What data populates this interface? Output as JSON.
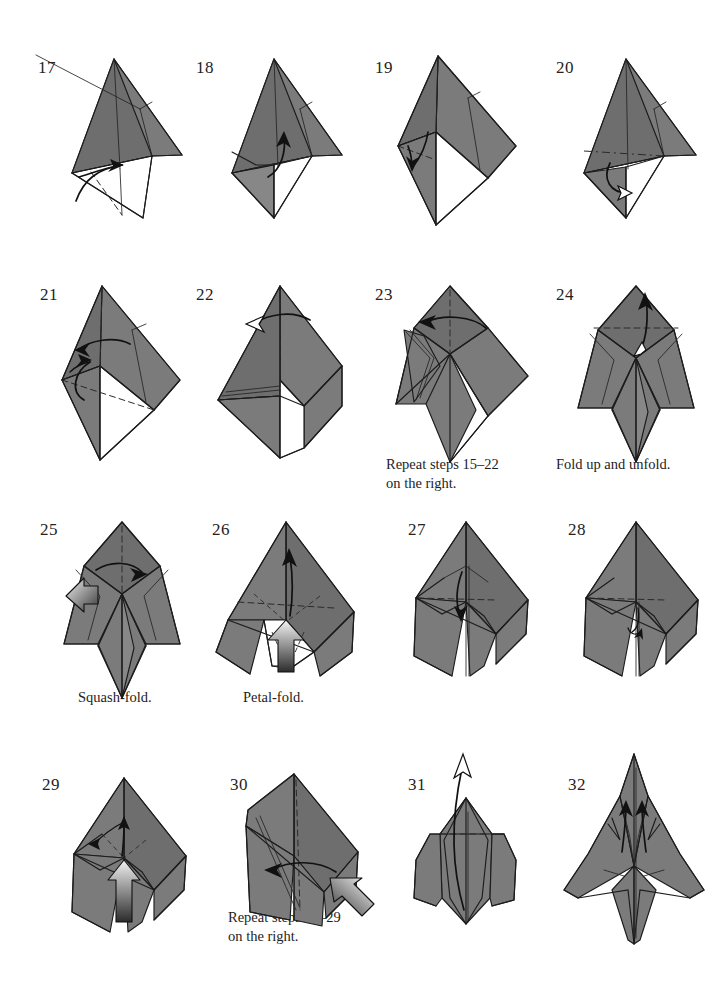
{
  "page": {
    "kind": "origami-instruction-diagram-page",
    "width": 720,
    "height": 982,
    "background_color": "#ffffff",
    "paper_color": "#7b7b7b",
    "line_color": "#1c1c1c",
    "columns": 4,
    "rows": 4
  },
  "steps": [
    {
      "number": "17",
      "num_x": 38,
      "num_y": 58,
      "fig_x": 36,
      "fig_y": 58,
      "caption": "",
      "caption_x": 0,
      "caption_y": 0,
      "variant": "kite-left-fold"
    },
    {
      "number": "18",
      "num_x": 196,
      "num_y": 58,
      "fig_x": 196,
      "fig_y": 58,
      "caption": "",
      "caption_x": 0,
      "caption_y": 0,
      "variant": "kite-flap-up"
    },
    {
      "number": "19",
      "num_x": 375,
      "num_y": 58,
      "fig_x": 370,
      "fig_y": 55,
      "caption": "",
      "caption_x": 0,
      "caption_y": 0,
      "variant": "kite-open-white"
    },
    {
      "number": "20",
      "num_x": 556,
      "num_y": 58,
      "fig_x": 552,
      "fig_y": 58,
      "caption": "",
      "caption_x": 0,
      "caption_y": 0,
      "variant": "kite-roll-under"
    },
    {
      "number": "21",
      "num_x": 40,
      "num_y": 285,
      "fig_x": 36,
      "fig_y": 282,
      "caption": "",
      "caption_x": 0,
      "caption_y": 0,
      "variant": "kite-left-swing"
    },
    {
      "number": "22",
      "num_x": 196,
      "num_y": 285,
      "fig_x": 190,
      "fig_y": 282,
      "caption": "",
      "caption_x": 0,
      "caption_y": 0,
      "variant": "kite-split-top"
    },
    {
      "number": "23",
      "num_x": 375,
      "num_y": 285,
      "fig_x": 370,
      "fig_y": 282,
      "caption": "Repeat steps 15–22\non the right.",
      "caption_x": 386,
      "caption_y": 455,
      "variant": "half-legs"
    },
    {
      "number": "24",
      "num_x": 556,
      "num_y": 285,
      "fig_x": 552,
      "fig_y": 282,
      "caption": "Fold up and unfold.",
      "caption_x": 556,
      "caption_y": 455,
      "variant": "two-legs-symmetric"
    },
    {
      "number": "25",
      "num_x": 40,
      "num_y": 520,
      "fig_x": 36,
      "fig_y": 516,
      "caption": "Squash-fold.",
      "caption_x": 78,
      "caption_y": 688,
      "variant": "squash"
    },
    {
      "number": "26",
      "num_x": 212,
      "num_y": 520,
      "fig_x": 196,
      "fig_y": 516,
      "caption": "Petal-fold.",
      "caption_x": 243,
      "caption_y": 688,
      "variant": "petal"
    },
    {
      "number": "27",
      "num_x": 408,
      "num_y": 520,
      "fig_x": 378,
      "fig_y": 516,
      "caption": "",
      "caption_x": 0,
      "caption_y": 0,
      "variant": "petal-done-arrow-down"
    },
    {
      "number": "28",
      "num_x": 568,
      "num_y": 520,
      "fig_x": 548,
      "fig_y": 516,
      "caption": "",
      "caption_x": 0,
      "caption_y": 0,
      "variant": "petal-done-small-arrow"
    },
    {
      "number": "29",
      "num_x": 42,
      "num_y": 775,
      "fig_x": 36,
      "fig_y": 762,
      "caption": "",
      "caption_x": 0,
      "caption_y": 0,
      "variant": "push-up"
    },
    {
      "number": "30",
      "num_x": 230,
      "num_y": 775,
      "fig_x": 196,
      "fig_y": 762,
      "caption": "Repeat steps 25–29\non the right.",
      "caption_x": 228,
      "caption_y": 908,
      "variant": "swing-left"
    },
    {
      "number": "31",
      "num_x": 408,
      "num_y": 775,
      "fig_x": 378,
      "fig_y": 752,
      "caption": "",
      "caption_x": 0,
      "caption_y": 0,
      "variant": "long-arrow-up"
    },
    {
      "number": "32",
      "num_x": 568,
      "num_y": 775,
      "fig_x": 548,
      "fig_y": 752,
      "caption": "",
      "caption_x": 0,
      "caption_y": 0,
      "variant": "final-rocket"
    }
  ]
}
